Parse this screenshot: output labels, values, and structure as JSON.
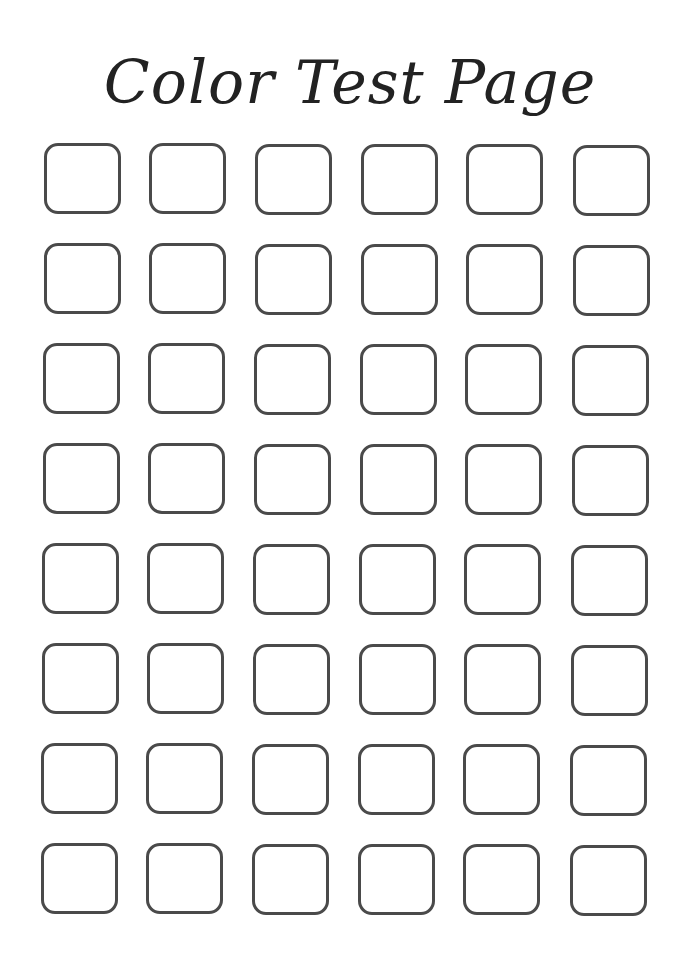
{
  "page": {
    "title": "Color Test Page",
    "swatch_grid": {
      "rows": 8,
      "columns": 6,
      "outline_color": "#4a4a4a"
    }
  }
}
